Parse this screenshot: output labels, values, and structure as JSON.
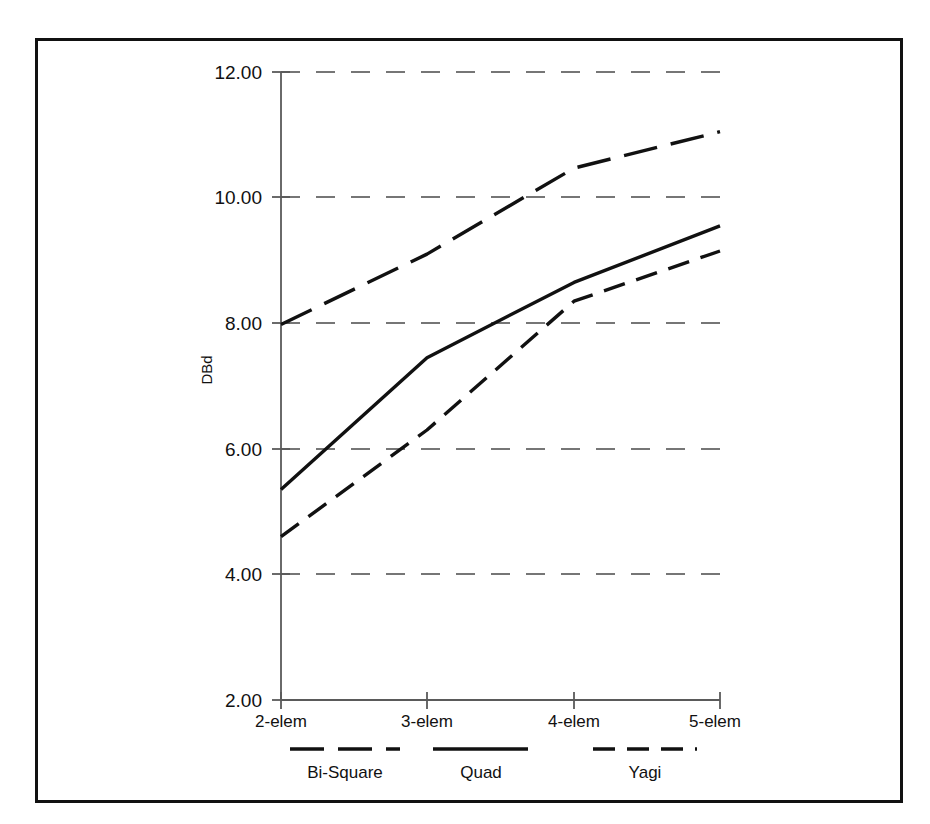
{
  "figure": {
    "background_color": "#ffffff",
    "frame_color": "#111111",
    "line_color": "#111111",
    "grid_color": "#4a4a4a"
  },
  "axes": {
    "y_axis_title": "DBd",
    "y_ticks": [
      "2.00",
      "4.00",
      "6.00",
      "8.00",
      "10.00",
      "12.00"
    ],
    "x_ticks": [
      "2-elem",
      "3-elem",
      "4-elem",
      "5-elem"
    ]
  },
  "legend": {
    "entries": [
      {
        "label": "Bi-Square",
        "dash": "long-dash"
      },
      {
        "label": "Quad",
        "dash": "solid"
      },
      {
        "label": "Yagi",
        "dash": "short-dash"
      }
    ]
  },
  "chart_data": {
    "type": "line",
    "title": "",
    "xlabel": "",
    "ylabel": "DBd",
    "categories": [
      "2-elem",
      "3-elem",
      "4-elem",
      "5-elem"
    ],
    "x": [
      2,
      3,
      4,
      5
    ],
    "ylim": [
      2.0,
      12.0
    ],
    "ytick_values": [
      2.0,
      4.0,
      6.0,
      8.0,
      10.0,
      12.0
    ],
    "grid": true,
    "grid_axis": "y",
    "legend_position": "below-axes",
    "series": [
      {
        "name": "Bi-Square",
        "style": "long-dash",
        "values": [
          7.98,
          9.1,
          10.47,
          11.05
        ]
      },
      {
        "name": "Quad",
        "style": "solid",
        "values": [
          5.35,
          7.45,
          8.65,
          9.55
        ]
      },
      {
        "name": "Yagi",
        "style": "short-dash",
        "values": [
          4.6,
          6.3,
          8.35,
          9.15
        ]
      }
    ]
  }
}
